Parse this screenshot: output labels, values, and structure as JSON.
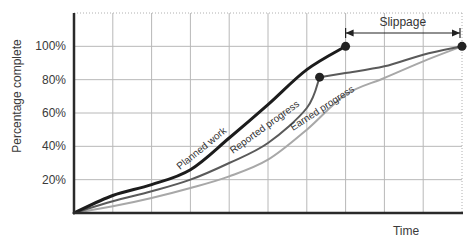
{
  "chart_data": {
    "type": "line",
    "title": "",
    "xlabel": "Time",
    "ylabel": "Percentage complete",
    "xlim": [
      0,
      10
    ],
    "ylim": [
      0,
      120
    ],
    "grid": true,
    "yticks": [
      {
        "value": 20,
        "label": "20%"
      },
      {
        "value": 40,
        "label": "40%"
      },
      {
        "value": 60,
        "label": "60%"
      },
      {
        "value": 80,
        "label": "80%"
      },
      {
        "value": 100,
        "label": "100%"
      }
    ],
    "x_gridlines": [
      1,
      2,
      3,
      4,
      5,
      6,
      7,
      8,
      9,
      10
    ],
    "series": [
      {
        "name": "Planned work",
        "color": "#1c1c1c",
        "x": [
          0,
          1,
          2,
          3,
          4,
          5,
          6,
          7
        ],
        "y": [
          0,
          10.5,
          17,
          26,
          45,
          65,
          86,
          100
        ],
        "end_marker": true
      },
      {
        "name": "Reported progress",
        "color": "#5a5a5a",
        "x": [
          0,
          1,
          2,
          3,
          4,
          5,
          6,
          6.33,
          7,
          8,
          9,
          10
        ],
        "y": [
          0,
          7,
          13,
          20,
          30,
          42,
          63,
          81.5,
          84,
          88,
          95,
          100
        ],
        "marker_index": 7,
        "end_marker": true
      },
      {
        "name": "Earned progress",
        "color": "#a8a8a8",
        "x": [
          0,
          1,
          2,
          3,
          4,
          5,
          6,
          7,
          8,
          9,
          10
        ],
        "y": [
          0,
          4,
          9,
          15,
          22,
          32,
          50,
          71,
          81,
          91,
          100
        ]
      }
    ],
    "annotations": [
      {
        "type": "double-arrow",
        "label": "Slippage",
        "x_from": 7,
        "x_to": 10,
        "y": 108
      }
    ]
  }
}
